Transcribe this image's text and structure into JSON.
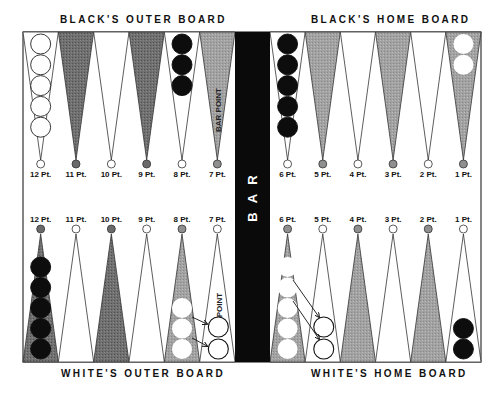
{
  "titles": {
    "top_left": "BLACK'S OUTER BOARD",
    "top_right": "BLACK'S HOME BOARD",
    "bottom_left": "WHITE'S OUTER BOARD",
    "bottom_right": "WHITE'S HOME BOARD"
  },
  "bar": {
    "label": "B A R"
  },
  "annotations": {
    "bar_point": "BAR POINT",
    "point": "POINT"
  },
  "colors": {
    "dark_point": "#6e6e6e",
    "light_point": "#ffffff",
    "shaded_point": "#9a9a9a",
    "black_checker": "#0d0d0d",
    "white_checker": "#ffffff",
    "bar": "#0a0a0a",
    "line": "#222222"
  },
  "top_points": [
    {
      "label": "12 Pt.",
      "fill": "light",
      "checkers": {
        "color": "white",
        "count": 5
      }
    },
    {
      "label": "11 Pt.",
      "fill": "dark",
      "checkers": {
        "color": "none",
        "count": 0
      }
    },
    {
      "label": "10 Pt.",
      "fill": "light",
      "checkers": {
        "color": "none",
        "count": 0
      }
    },
    {
      "label": "9 Pt.",
      "fill": "dark",
      "checkers": {
        "color": "none",
        "count": 0
      }
    },
    {
      "label": "8 Pt.",
      "fill": "light",
      "checkers": {
        "color": "black",
        "count": 3
      }
    },
    {
      "label": "7 Pt.",
      "fill": "shaded",
      "checkers": {
        "color": "none",
        "count": 0
      }
    },
    {
      "label": "6 Pt.",
      "fill": "light",
      "checkers": {
        "color": "black",
        "count": 5
      }
    },
    {
      "label": "5 Pt.",
      "fill": "shaded",
      "checkers": {
        "color": "none",
        "count": 0
      }
    },
    {
      "label": "4 Pt.",
      "fill": "light",
      "checkers": {
        "color": "none",
        "count": 0
      }
    },
    {
      "label": "3 Pt.",
      "fill": "shaded",
      "checkers": {
        "color": "none",
        "count": 0
      }
    },
    {
      "label": "2 Pt.",
      "fill": "light",
      "checkers": {
        "color": "none",
        "count": 0
      }
    },
    {
      "label": "1 Pt.",
      "fill": "shaded",
      "checkers": {
        "color": "white",
        "count": 2
      }
    }
  ],
  "bottom_points": [
    {
      "label": "12 Pt.",
      "fill": "dark",
      "checkers": {
        "color": "black",
        "count": 5
      }
    },
    {
      "label": "11 Pt.",
      "fill": "light",
      "checkers": {
        "color": "none",
        "count": 0
      }
    },
    {
      "label": "10 Pt.",
      "fill": "dark",
      "checkers": {
        "color": "none",
        "count": 0
      }
    },
    {
      "label": "9 Pt.",
      "fill": "light",
      "checkers": {
        "color": "none",
        "count": 0
      }
    },
    {
      "label": "8 Pt.",
      "fill": "shaded",
      "checkers": {
        "color": "white",
        "count": 3
      }
    },
    {
      "label": "7 Pt.",
      "fill": "light",
      "checkers": {
        "color": "outline",
        "count": 2
      }
    },
    {
      "label": "6 Pt.",
      "fill": "shaded",
      "checkers": {
        "color": "white",
        "count": 5
      }
    },
    {
      "label": "5 Pt.",
      "fill": "light",
      "checkers": {
        "color": "outline",
        "count": 2
      }
    },
    {
      "label": "4 Pt.",
      "fill": "shaded",
      "checkers": {
        "color": "none",
        "count": 0
      }
    },
    {
      "label": "3 Pt.",
      "fill": "light",
      "checkers": {
        "color": "none",
        "count": 0
      }
    },
    {
      "label": "2 Pt.",
      "fill": "shaded",
      "checkers": {
        "color": "none",
        "count": 0
      }
    },
    {
      "label": "1 Pt.",
      "fill": "light",
      "checkers": {
        "color": "black",
        "count": 2
      }
    }
  ],
  "moves": [
    {
      "from": "8 Pt.",
      "to": "7 Pt.",
      "count": 2,
      "description": "White makes the bar point"
    },
    {
      "from": "6 Pt.",
      "to": "5 Pt.",
      "count": 2,
      "description": "White makes the 5 point"
    }
  ]
}
